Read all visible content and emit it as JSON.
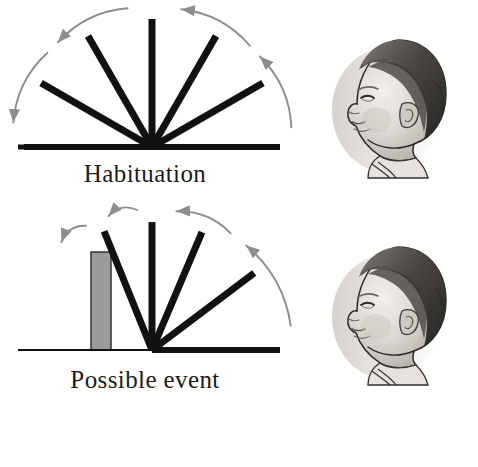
{
  "figure": {
    "background_color": "#ffffff",
    "ink_color": "#111111",
    "arrow_color": "#8d8d8d",
    "box_fill_color": "#9b9b9b"
  },
  "panels": [
    {
      "id": "habituation",
      "caption": "Habituation",
      "pivot": {
        "x": 152,
        "y": 147
      },
      "ground": {
        "x1": 18,
        "x2": 272,
        "y": 147,
        "thickness": 5
      },
      "has_box": false,
      "flap_length": 128,
      "flap_thickness": 7,
      "flap_angles_deg": [
        0,
        30,
        60,
        90,
        120,
        150,
        180
      ],
      "rotation_span_deg": [
        0,
        180
      ],
      "arrows": [
        {
          "from_deg": 8,
          "to_deg": 40,
          "direction": "counterclockwise"
        },
        {
          "from_deg": 46,
          "to_deg": 78,
          "direction": "counterclockwise"
        },
        {
          "from_deg": 100,
          "to_deg": 132,
          "direction": "counterclockwise"
        },
        {
          "from_deg": 138,
          "to_deg": 170,
          "direction": "counterclockwise"
        }
      ]
    },
    {
      "id": "possible_event",
      "caption": "Possible event",
      "pivot": {
        "x": 152,
        "y": 350
      },
      "ground": {
        "x1": 18,
        "x2": 272,
        "y": 350,
        "thickness": 2
      },
      "has_box": true,
      "box": {
        "x": 91,
        "y": 252,
        "width": 20,
        "height": 98
      },
      "flap_length": 128,
      "flap_thickness": 7,
      "flap_angles_deg": [
        0,
        37,
        67,
        90,
        112
      ],
      "rotation_span_deg": [
        0,
        112
      ],
      "arrows": [
        {
          "from_deg": 10,
          "to_deg": 48,
          "direction": "counterclockwise"
        },
        {
          "from_deg": 56,
          "to_deg": 80,
          "direction": "counterclockwise"
        },
        {
          "from_deg": 96,
          "to_deg": 108,
          "direction": "counterclockwise"
        },
        {
          "from_deg": 118,
          "to_deg": 130,
          "direction": "counterclockwise"
        }
      ]
    }
  ],
  "infant_images": [
    {
      "id": "infant-top",
      "alt_text": "Infant head in profile facing left",
      "x": 328,
      "y": 28,
      "width": 132,
      "height": 152
    },
    {
      "id": "infant-bottom",
      "alt_text": "Infant head in profile facing left",
      "x": 328,
      "y": 235,
      "width": 132,
      "height": 152
    }
  ]
}
